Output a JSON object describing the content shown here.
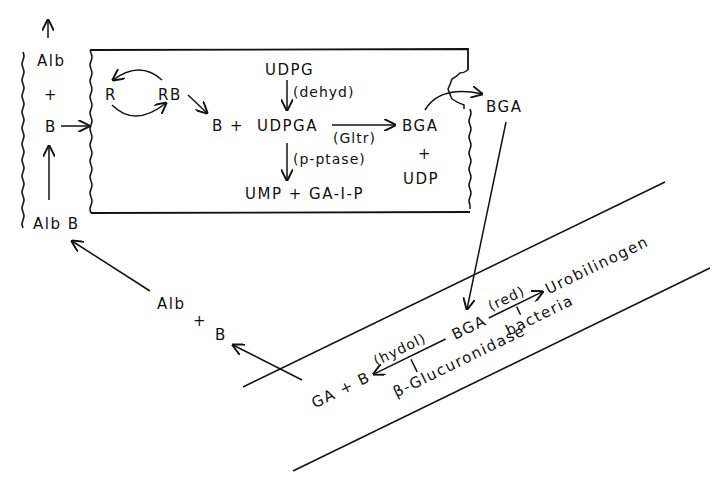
{
  "diagram": {
    "type": "biochemical-pathway",
    "colors": {
      "ink": "#111111",
      "background": "#ffffff"
    },
    "blood": {
      "alb_top": "Alb",
      "plus": "+",
      "b": "B",
      "alb_b": "Alb B"
    },
    "liver_cell": {
      "r": "R",
      "rb": "RB",
      "b_plus": "B +",
      "udpg": "UDPG",
      "dehyd": "(dehyd)",
      "udpga": "UDPGA",
      "gltr": "(Gltr)",
      "bga": "BGA",
      "plus": "+",
      "udp": "UDP",
      "p_ptase": "(p-ptase)",
      "ump_ga1p": "UMP + GA-I-P"
    },
    "excreted": {
      "bga": "BGA"
    },
    "return_path": {
      "alb": "Alb",
      "plus": "+",
      "b": "B"
    },
    "intestine": {
      "bga": "BGA",
      "red": "(red)",
      "urobilinogen": "Urobilinogen",
      "bacteria": "bacteria",
      "hydol": "(hydol)",
      "ga_plus_b": "GA + B",
      "beta_glucuronidase": "β-Glucuronidase"
    }
  }
}
